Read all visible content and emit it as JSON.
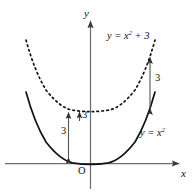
{
  "figure": {
    "background_color": "#ffffff",
    "axis_color": "#6e6e6e",
    "solid_curve_color": "#111111",
    "dashed_curve_color": "#111111",
    "arrow_color": "#555555",
    "label_color": "#111111"
  },
  "axes": {
    "y_label": "y",
    "x_label": "x",
    "origin_label": "O"
  },
  "curves": [
    {
      "id": "lower",
      "label_prefix": "y = x",
      "label_exponent": "2",
      "label_suffix": "",
      "label_text": "y = x²",
      "style": "solid",
      "equation": "y = x^2",
      "vertex": [
        0,
        0
      ]
    },
    {
      "id": "upper",
      "label_prefix": "y = x",
      "label_exponent": "2",
      "label_suffix": " + 3",
      "label_text": "y = x² + 3",
      "style": "dashed",
      "equation": "y = x^2 + 3",
      "vertex": [
        0,
        3
      ]
    }
  ],
  "measurements": [
    {
      "id": "left",
      "value": "3"
    },
    {
      "id": "center",
      "value": "3"
    },
    {
      "id": "right",
      "value": "3"
    }
  ]
}
